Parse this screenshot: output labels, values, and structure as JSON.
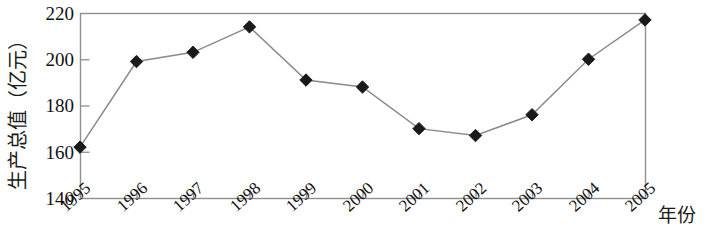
{
  "chart_data": {
    "type": "line",
    "title": "",
    "xlabel": "年份",
    "ylabel": "生产总值（亿元）",
    "categories": [
      "1995",
      "1996",
      "1997",
      "1998",
      "1999",
      "2000",
      "2001",
      "2002",
      "2003",
      "2004",
      "2005"
    ],
    "values": [
      162,
      199,
      203,
      214,
      191,
      188,
      170,
      167,
      176,
      200,
      217
    ],
    "series": [
      {
        "name": "生产总值",
        "values": [
          162,
          199,
          203,
          214,
          191,
          188,
          170,
          167,
          176,
          200,
          217
        ]
      }
    ],
    "ylim": [
      140,
      220
    ],
    "yticks": [
      140,
      160,
      180,
      200,
      220
    ],
    "ytick_labels": [
      "140",
      "160",
      "180",
      "200",
      "220"
    ],
    "xtick_labels": [
      "1995",
      "1996",
      "1997",
      "1998",
      "1999",
      "2000",
      "2001",
      "2002",
      "2003",
      "2004",
      "2005"
    ],
    "grid": false,
    "legend": false,
    "legend_position": "none",
    "marker": "diamond",
    "marker_color": "#1a1a1a",
    "line_color": "#8a8a8a",
    "frame_color": "#8f8f8f",
    "background": "#ffffff"
  },
  "axes": {
    "y_title": "生产总值（亿元）",
    "x_title": "年份",
    "y_ticks": [
      {
        "label": "220",
        "value": 220
      },
      {
        "label": "200",
        "value": 200
      },
      {
        "label": "180",
        "value": 180
      },
      {
        "label": "160",
        "value": 160
      },
      {
        "label": "140",
        "value": 140
      }
    ],
    "x_ticks": [
      {
        "label": "1995",
        "value": 162
      },
      {
        "label": "1996",
        "value": 199
      },
      {
        "label": "1997",
        "value": 203
      },
      {
        "label": "1998",
        "value": 214
      },
      {
        "label": "1999",
        "value": 191
      },
      {
        "label": "2000",
        "value": 188
      },
      {
        "label": "2001",
        "value": 170
      },
      {
        "label": "2002",
        "value": 167
      },
      {
        "label": "2003",
        "value": 176
      },
      {
        "label": "2004",
        "value": 200
      },
      {
        "label": "2005",
        "value": 217
      }
    ]
  }
}
